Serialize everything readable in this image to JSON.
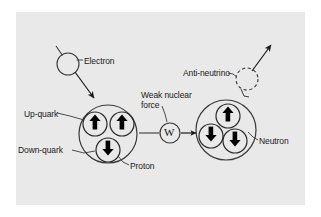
{
  "diagram": {
    "background_color": "#e9e9e9",
    "line_color": "#333333",
    "labels": {
      "electron": "Electron",
      "up_quark": "Up-quark",
      "down_quark": "Down-quark",
      "proton": "Proton",
      "weak_force_line1": "Weak nuclear",
      "weak_force_line2": "force",
      "boson": "W",
      "anti_neutrino": "Anti-neutrino",
      "neutron": "Neutron"
    },
    "particles": [
      {
        "name": "electron",
        "label": "Electron",
        "shape": "circle",
        "style": "solid",
        "cx": 68,
        "cy": 64,
        "r": 11
      },
      {
        "name": "proton",
        "label": "Proton",
        "shape": "circle",
        "style": "solid",
        "cx": 108,
        "cy": 134,
        "r": 29
      },
      {
        "name": "w-boson",
        "label": "W",
        "shape": "circle",
        "style": "solid",
        "cx": 170,
        "cy": 133,
        "r": 10
      },
      {
        "name": "neutron",
        "label": "Neutron",
        "shape": "circle",
        "style": "solid",
        "cx": 226,
        "cy": 130,
        "r": 30
      },
      {
        "name": "anti-neutrino",
        "label": "Anti-neutrino",
        "shape": "circle",
        "style": "dashed",
        "cx": 247,
        "cy": 79,
        "r": 11
      }
    ],
    "quarks": [
      {
        "parent": "proton",
        "type": "up",
        "arrow": "up",
        "cx": 95,
        "cy": 124,
        "r": 12
      },
      {
        "parent": "proton",
        "type": "up",
        "arrow": "up",
        "cx": 122,
        "cy": 124,
        "r": 12
      },
      {
        "parent": "proton",
        "type": "down",
        "arrow": "down",
        "cx": 108,
        "cy": 150,
        "r": 12
      },
      {
        "parent": "neutron",
        "type": "up",
        "arrow": "up",
        "cx": 228,
        "cy": 116,
        "r": 12
      },
      {
        "parent": "neutron",
        "type": "down",
        "arrow": "down",
        "cx": 211,
        "cy": 136,
        "r": 12
      },
      {
        "parent": "neutron",
        "type": "down",
        "arrow": "down",
        "cx": 235,
        "cy": 141,
        "r": 12
      }
    ],
    "arrows": [
      {
        "name": "electron-incoming",
        "from": [
          56,
          47
        ],
        "to": [
          62,
          56
        ],
        "head": false
      },
      {
        "name": "electron-into-proton",
        "from": [
          75,
          72
        ],
        "to": [
          95,
          99
        ],
        "head": true
      },
      {
        "name": "proton-to-w",
        "from": [
          139,
          133
        ],
        "to": [
          159,
          133
        ],
        "head": false
      },
      {
        "name": "w-to-neutron",
        "from": [
          181,
          133
        ],
        "to": [
          197,
          133
        ],
        "head": true
      },
      {
        "name": "anti-neutrino-outgoing",
        "from": [
          252,
          70
        ],
        "to": [
          272,
          45
        ],
        "head": true
      }
    ],
    "leaders": [
      {
        "name": "electron-leader",
        "from": [
          83,
          60
        ],
        "to": [
          76,
          60
        ]
      },
      {
        "name": "up-quark-leader",
        "from": [
          57,
          113
        ],
        "to": [
          84,
          120
        ]
      },
      {
        "name": "down-quark-leader",
        "from": [
          72,
          150
        ],
        "to": [
          95,
          151
        ]
      },
      {
        "name": "proton-leader",
        "from": [
          129,
          164
        ],
        "to": [
          119,
          157
        ]
      },
      {
        "name": "weak-force-leader",
        "from": [
          162,
          105
        ],
        "to": [
          167,
          122
        ]
      },
      {
        "name": "anti-neutrino-leader",
        "from": [
          228,
          73
        ],
        "to": [
          237,
          76
        ]
      },
      {
        "name": "neutron-leader",
        "from": [
          258,
          139
        ],
        "to": [
          249,
          133
        ]
      }
    ]
  }
}
